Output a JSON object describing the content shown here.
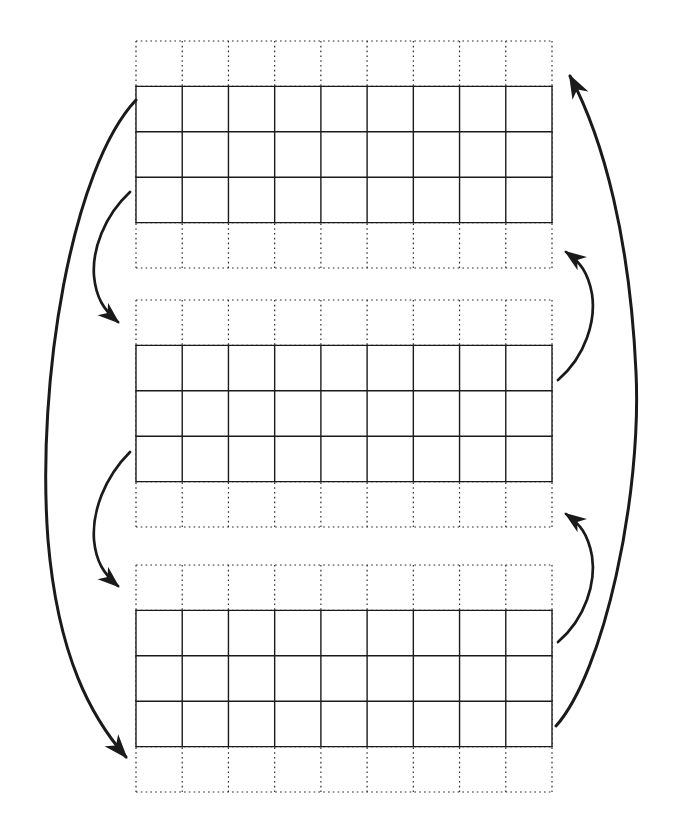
{
  "diagram": {
    "background_color": "#ffffff",
    "stroke_color": "#1a1a1a",
    "dotted_stroke_color": "#2b2b2b",
    "canvas": {
      "width": 683,
      "height": 824
    },
    "grid_spec": {
      "columns": 9,
      "dotted_rows": 5,
      "solid_rows": 3,
      "solid_row_offset": 1,
      "cell_width": 46.2,
      "cell_height": 45.4,
      "solid_line_width": 1.4,
      "dotted_line_width": 1.2,
      "dotted_dash_pattern": "1.6 3.2"
    },
    "blocks": [
      {
        "id": "block-1",
        "label": "Grid block 1",
        "x": 136,
        "y": 41,
        "width": 416,
        "height": 227
      },
      {
        "id": "block-2",
        "label": "Grid block 2",
        "x": 136,
        "y": 300,
        "width": 416,
        "height": 227
      },
      {
        "id": "block-3",
        "label": "Grid block 3",
        "x": 136,
        "y": 565,
        "width": 416,
        "height": 227
      }
    ],
    "arrows": [
      {
        "id": "arrow-left-long",
        "label": "Long left arc, block 1 to block 3",
        "side": "left",
        "direction": "down",
        "from_block": "block-1",
        "to_block": "block-3",
        "path": "M 136 100 C 72 168, 36 380, 48 540 C 58 658, 92 718, 126 757",
        "arrowhead": "end",
        "stroke_width": 3.0
      },
      {
        "id": "arrow-left-short-1",
        "label": "Short left arc, block 1 to block 2",
        "side": "left",
        "direction": "down",
        "from_block": "block-1",
        "to_block": "block-2",
        "path": "M 130 192 C 104 216, 92 250, 94 276 C 96 298, 104 310, 118 322",
        "arrowhead": "end",
        "stroke_width": 2.7
      },
      {
        "id": "arrow-left-short-2",
        "label": "Short left arc, block 2 to block 3",
        "side": "left",
        "direction": "down",
        "from_block": "block-2",
        "to_block": "block-3",
        "path": "M 130 452 C 104 478, 92 512, 94 540 C 96 562, 104 574, 118 586",
        "arrowhead": "end",
        "stroke_width": 2.7
      },
      {
        "id": "arrow-right-long",
        "label": "Long right arc, block 3 to block 1",
        "side": "right",
        "direction": "up",
        "from_block": "block-3",
        "to_block": "block-1",
        "path": "M 556 726 C 604 672, 642 496, 636 372 C 630 240, 604 140, 570 76",
        "arrowhead": "end",
        "stroke_width": 3.0
      },
      {
        "id": "arrow-right-short-1",
        "label": "Short right arc, block 2 to block 1",
        "side": "right",
        "direction": "up",
        "from_block": "block-2",
        "to_block": "block-1",
        "path": "M 558 380 C 586 356, 596 320, 592 294 C 588 272, 580 262, 566 252",
        "arrowhead": "end",
        "stroke_width": 2.7
      },
      {
        "id": "arrow-right-short-2",
        "label": "Short right arc, block 3 to block 2",
        "side": "right",
        "direction": "up",
        "from_block": "block-3",
        "to_block": "block-2",
        "path": "M 558 642 C 586 618, 596 582, 592 556 C 588 534, 580 524, 566 514",
        "arrowhead": "end",
        "stroke_width": 2.7
      }
    ]
  }
}
